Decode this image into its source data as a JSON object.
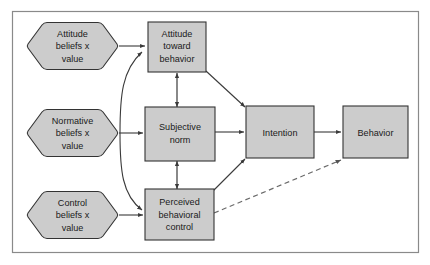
{
  "diagram": {
    "frame": {
      "stroke": "#8a8a8a",
      "fill": "#ffffff"
    },
    "style": {
      "node_fill": "#cccccc",
      "node_stroke": "#333333",
      "connector_stroke": "#3a3a3a",
      "dashed_stroke": "#6a6a6a"
    },
    "nodes": [
      {
        "id": "attitude-beliefs",
        "shape": "hexagon",
        "lines": [
          "Attitude",
          "beliefs x",
          "value"
        ]
      },
      {
        "id": "normative-beliefs",
        "shape": "hexagon",
        "lines": [
          "Normative",
          "beliefs x",
          "value"
        ]
      },
      {
        "id": "control-beliefs",
        "shape": "hexagon",
        "lines": [
          "Control",
          "beliefs x",
          "value"
        ]
      },
      {
        "id": "attitude-toward-behavior",
        "shape": "rect",
        "lines": [
          "Attitude",
          "toward",
          "behavior"
        ]
      },
      {
        "id": "subjective-norm",
        "shape": "rect",
        "lines": [
          "Subjective",
          "norm"
        ]
      },
      {
        "id": "perceived-behavioral-control",
        "shape": "rect",
        "lines": [
          "Perceived",
          "behavioral",
          "control"
        ]
      },
      {
        "id": "intention",
        "shape": "rect",
        "lines": [
          "Intention"
        ]
      },
      {
        "id": "behavior",
        "shape": "rect",
        "lines": [
          "Behavior"
        ]
      }
    ],
    "edges": [
      {
        "from": "attitude-beliefs",
        "to": "attitude-toward-behavior",
        "style": "solid",
        "arrow": "single"
      },
      {
        "from": "normative-beliefs",
        "to": "subjective-norm",
        "style": "solid",
        "arrow": "single"
      },
      {
        "from": "control-beliefs",
        "to": "perceived-behavioral-control",
        "style": "solid",
        "arrow": "single"
      },
      {
        "from": "normative-beliefs",
        "to": "attitude-toward-behavior",
        "style": "curved",
        "arrow": "single"
      },
      {
        "from": "normative-beliefs",
        "to": "perceived-behavioral-control",
        "style": "curved",
        "arrow": "single"
      },
      {
        "from": "attitude-toward-behavior",
        "to": "subjective-norm",
        "style": "solid",
        "arrow": "double"
      },
      {
        "from": "subjective-norm",
        "to": "perceived-behavioral-control",
        "style": "solid",
        "arrow": "double"
      },
      {
        "from": "attitude-toward-behavior",
        "to": "intention",
        "style": "solid",
        "arrow": "single"
      },
      {
        "from": "subjective-norm",
        "to": "intention",
        "style": "solid",
        "arrow": "single"
      },
      {
        "from": "perceived-behavioral-control",
        "to": "intention",
        "style": "solid",
        "arrow": "single"
      },
      {
        "from": "intention",
        "to": "behavior",
        "style": "solid",
        "arrow": "single"
      },
      {
        "from": "perceived-behavioral-control",
        "to": "behavior",
        "style": "dashed",
        "arrow": "single"
      }
    ]
  }
}
